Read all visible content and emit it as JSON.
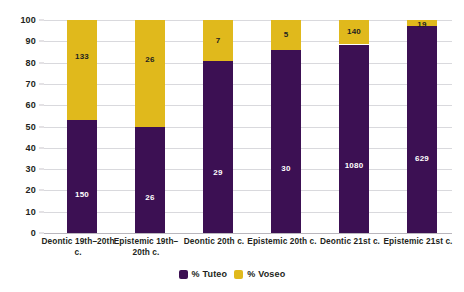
{
  "chart_data": {
    "type": "bar",
    "subtype": "stacked-100-percent",
    "title": "",
    "xlabel": "",
    "ylabel": "",
    "ylim": [
      0,
      100
    ],
    "ytick_labels": [
      "100",
      "90",
      "80",
      "70",
      "60",
      "50",
      "40",
      "30",
      "20",
      "10",
      "0"
    ],
    "ytick_values": [
      100,
      90,
      80,
      70,
      60,
      50,
      40,
      30,
      20,
      10,
      0
    ],
    "grid": true,
    "legend_position": "bottom-center",
    "categories": [
      "Deontic 19th–20th c.",
      "Epistemic 19th–20th c.",
      "Deontic 20th c.",
      "Epistemic 20th c.",
      "Deontic 21st c.",
      "Epistemic 21st c."
    ],
    "series": [
      {
        "name": "% Tuteo",
        "color": "#3c1053",
        "values": [
          53.0,
          50.0,
          80.6,
          85.7,
          88.5,
          97.1
        ],
        "data_labels": [
          "150",
          "26",
          "29",
          "30",
          "1080",
          "629"
        ]
      },
      {
        "name": "% Voseo",
        "color": "#e0b91c",
        "values": [
          47.0,
          50.0,
          19.4,
          14.3,
          11.5,
          2.9
        ],
        "data_labels": [
          "133",
          "26",
          "7",
          "5",
          "140",
          "19"
        ]
      }
    ]
  },
  "legend": {
    "items": [
      {
        "label": "% Tuteo",
        "color": "#3c1053"
      },
      {
        "label": "% Voseo",
        "color": "#e0b91c"
      }
    ]
  }
}
